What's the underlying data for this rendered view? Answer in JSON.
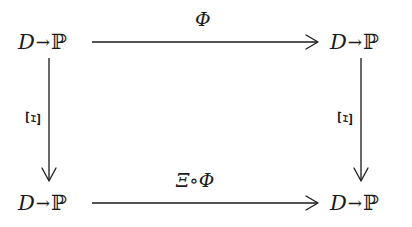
{
  "diagram": {
    "type": "commutative-square",
    "nodes": {
      "top_left": {
        "domain": "D",
        "arrow": "→",
        "codomain": "ℙ"
      },
      "top_right": {
        "domain": "D",
        "arrow": "→",
        "codomain": "ℙ"
      },
      "bottom_left": {
        "domain": "D",
        "arrow": "→",
        "codomain": "ℙ"
      },
      "bottom_right": {
        "domain": "D",
        "arrow": "→",
        "codomain": "ℙ"
      }
    },
    "edges": {
      "top": {
        "label": "Φ",
        "from": "top_left",
        "to": "top_right"
      },
      "bottom": {
        "label": "Ξ∘Φ",
        "from": "bottom_left",
        "to": "bottom_right"
      },
      "left": {
        "label": "Ξ",
        "from": "top_left",
        "to": "bottom_left"
      },
      "right": {
        "label": "Ξ",
        "from": "top_right",
        "to": "bottom_right"
      }
    },
    "colors": {
      "ink": "#1a1a1a",
      "background": "#ffffff"
    }
  }
}
